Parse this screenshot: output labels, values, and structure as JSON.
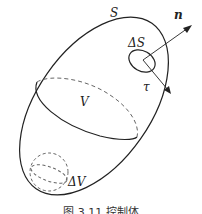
{
  "figure": {
    "labels": {
      "surface": "S",
      "normal": "n",
      "surface_element": "ΔS",
      "tangent": "τ",
      "volume": "V",
      "volume_element": "ΔV"
    },
    "caption": "图 3.11  控制体"
  },
  "colors": {
    "stroke": "#222222",
    "dashed": "#666666",
    "background": "#ffffff"
  }
}
